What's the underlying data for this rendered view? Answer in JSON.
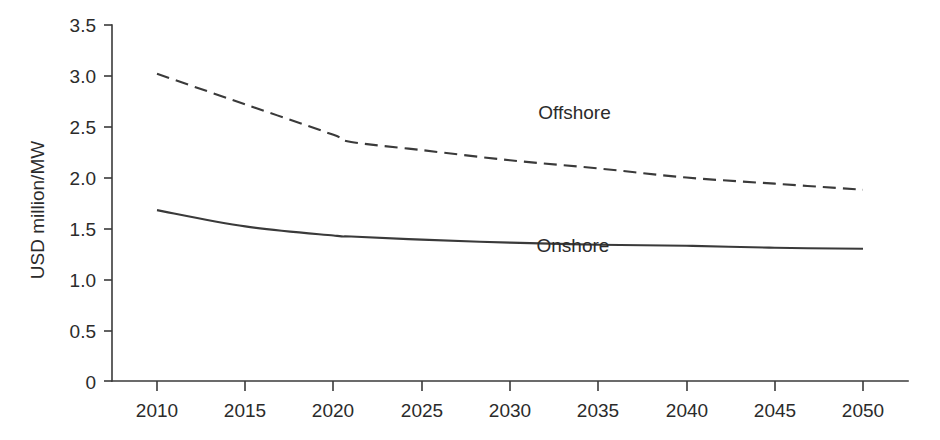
{
  "chart_data": {
    "type": "line",
    "title": "",
    "xlabel": "",
    "ylabel": "USD million/MW",
    "x": [
      2010,
      2015,
      2020,
      2021,
      2025,
      2030,
      2035,
      2040,
      2045,
      2050
    ],
    "xlim": [
      2008,
      2052
    ],
    "ylim": [
      0,
      3.5
    ],
    "xticks": [
      "2010",
      "2015",
      "2020",
      "2025",
      "2030",
      "2035",
      "2040",
      "2045",
      "2050"
    ],
    "yticks": [
      "0",
      "0.5",
      "1.0",
      "1.5",
      "2.0",
      "2.5",
      "3.0",
      "3.5"
    ],
    "grid": false,
    "legend_position": "inline-annotation",
    "series": [
      {
        "name": "Offshore",
        "style": "dashed",
        "color": "#3a3a3a",
        "values": [
          3.02,
          2.72,
          2.42,
          2.35,
          2.27,
          2.17,
          2.09,
          2.0,
          1.94,
          1.88
        ],
        "label_x": 2031.6,
        "label_y": 2.58
      },
      {
        "name": "Onshore",
        "style": "solid",
        "color": "#3a3a3a",
        "values": [
          1.68,
          1.52,
          1.43,
          1.42,
          1.39,
          1.36,
          1.34,
          1.33,
          1.31,
          1.3
        ],
        "label_x": 2031.5,
        "label_y": 1.27
      }
    ]
  },
  "axes": {
    "y_title": "USD million/MW",
    "y_tick_labels": [
      "3.5",
      "3.0",
      "2.5",
      "2.0",
      "1.5",
      "1.0",
      "0.5",
      "0"
    ],
    "x_tick_labels": [
      "2010",
      "2015",
      "2020",
      "2025",
      "2030",
      "2035",
      "2040",
      "2045",
      "2050"
    ]
  },
  "annotations": {
    "offshore_label": "Offshore",
    "onshore_label": "Onshore"
  },
  "colors": {
    "ink": "#3a3a3a",
    "text": "#2b2b2b",
    "background": "#ffffff"
  }
}
